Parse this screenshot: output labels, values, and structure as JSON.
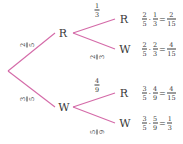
{
  "colors": {
    "branch": "#d46aa8",
    "text": "#3a3a3a"
  },
  "tree": {
    "first": {
      "R": {
        "label": "R",
        "prob": {
          "num": "2",
          "den": "5"
        }
      },
      "W": {
        "label": "W",
        "prob": {
          "num": "3",
          "den": "5"
        }
      }
    },
    "second": {
      "RR": {
        "label": "R",
        "prob": {
          "num": "1",
          "den": "3"
        },
        "calc": {
          "a_num": "2",
          "a_den": "5",
          "b_num": "1",
          "b_den": "3",
          "res_num": "2",
          "res_den": "15"
        }
      },
      "RW": {
        "label": "W",
        "prob": {
          "num": "2",
          "den": "3"
        },
        "calc": {
          "a_num": "2",
          "a_den": "5",
          "b_num": "2",
          "b_den": "3",
          "res_num": "4",
          "res_den": "15"
        }
      },
      "WR": {
        "label": "R",
        "prob": {
          "num": "4",
          "den": "9"
        },
        "calc": {
          "a_num": "3",
          "a_den": "5",
          "b_num": "4",
          "b_den": "9",
          "res_num": "4",
          "res_den": "15"
        }
      },
      "WW": {
        "label": "W",
        "prob": {
          "num": "5",
          "den": "9"
        },
        "calc": {
          "a_num": "3",
          "a_den": "5",
          "b_num": "5",
          "b_den": "9",
          "res_num": "1",
          "res_den": "3"
        }
      }
    },
    "ops": {
      "times": "·",
      "equals": "="
    }
  }
}
